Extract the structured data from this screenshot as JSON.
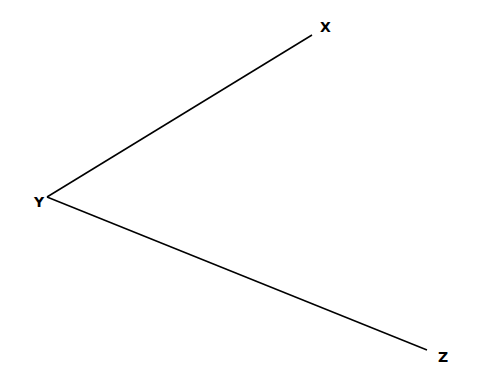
{
  "diagram": {
    "type": "angle",
    "colors": {
      "background": "#ffffff",
      "stroke": "#000000"
    },
    "vertex": {
      "label": "Y",
      "x": 47,
      "y": 197,
      "label_x": 34,
      "label_y": 207
    },
    "points": [
      {
        "label": "X",
        "x": 312,
        "y": 35,
        "label_x": 320,
        "label_y": 32
      },
      {
        "label": "Z",
        "x": 427,
        "y": 350,
        "label_x": 438,
        "label_y": 362
      }
    ],
    "segments": [
      {
        "from": "Y",
        "to": "X"
      },
      {
        "from": "Y",
        "to": "Z"
      }
    ]
  }
}
